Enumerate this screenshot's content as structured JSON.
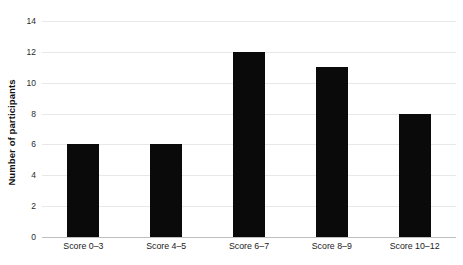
{
  "chart_data": {
    "type": "bar",
    "title": "",
    "xlabel": "",
    "ylabel": "Number of participants",
    "categories": [
      "Score 0–3",
      "Score 4–5",
      "Score 6–7",
      "Score 8–9",
      "Score 10–12"
    ],
    "values": [
      6,
      6,
      12,
      11,
      8
    ],
    "ylim": [
      0,
      14
    ],
    "ytick_labels": [
      "0",
      "2",
      "4",
      "6",
      "8",
      "10",
      "12",
      "14"
    ],
    "ytick_values": [
      0,
      2,
      4,
      6,
      8,
      10,
      12,
      14
    ],
    "grid": true,
    "legend": null,
    "bar_color": "#0a0a0a",
    "gridline_color": "#e8e8e8",
    "axis_color": "#bfbfbf",
    "background_color": "#ffffff"
  }
}
